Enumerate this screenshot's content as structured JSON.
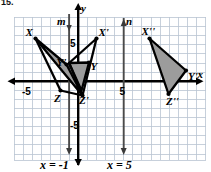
{
  "problem": {
    "number": "15."
  },
  "figure": {
    "type": "coordinate-plane-reflections",
    "axes": {
      "x_axis_label": "x",
      "y_axis_label": "y",
      "x_ticks": [
        {
          "label": "-5",
          "value": -5
        },
        {
          "label": "5",
          "value": 5
        }
      ],
      "y_ticks": [
        {
          "label": "5",
          "value": 5
        },
        {
          "label": "-5",
          "value": -5
        }
      ],
      "grid": "on",
      "x_range": [
        -8,
        9
      ],
      "y_range": [
        -7,
        7
      ]
    },
    "lines": [
      {
        "name": "m",
        "label": "m",
        "equation_label": "x = -1",
        "x": -1,
        "arrow": "down"
      },
      {
        "name": "n",
        "label": "n",
        "equation_label": "x = 5",
        "x": 5,
        "arrow": "up"
      }
    ],
    "triangles": [
      {
        "name": "XYZ",
        "fill": "#9c9c9c",
        "vertices": [
          {
            "label": "Y",
            "x": 1.2,
            "y": 2.0,
            "label_pos": "right"
          },
          {
            "label": "X",
            "x": -1.0,
            "y": 2.0,
            "label_pos": "left"
          },
          {
            "label": "Z",
            "x": 0.0,
            "y": -1.0,
            "label_pos": "below"
          }
        ]
      },
      {
        "name": "X'Y'Z'",
        "fill": "#9c9c9c",
        "vertices": [
          {
            "label": "X'",
            "x": 3.2,
            "y": 4.6,
            "label_pos": "above-right"
          },
          {
            "label": "Y'",
            "x": -1.4,
            "y": 2.1,
            "label_pos": "left"
          },
          {
            "label": "Z'",
            "x": 0.4,
            "y": -1.3,
            "label_pos": "below-right"
          }
        ]
      },
      {
        "name": "X''Y''Z''",
        "fill": "#9c9c9c",
        "vertices": [
          {
            "label": "X''",
            "x": 6.8,
            "y": 4.6,
            "label_pos": "above-left"
          },
          {
            "label": "Y''",
            "x": 9.3,
            "y": 1.2,
            "label_pos": "right"
          },
          {
            "label": "Z''",
            "x": 7.6,
            "y": -1.3,
            "label_pos": "below"
          }
        ]
      }
    ],
    "colors": {
      "grid": "#b9c4d2",
      "grid_border": "#8d98a8",
      "axis": "#000000",
      "triangle_fill": "#9c9c9c",
      "triangle_stroke": "#000000",
      "reflect_line": "#4a4a4a",
      "text": "#000000"
    }
  }
}
